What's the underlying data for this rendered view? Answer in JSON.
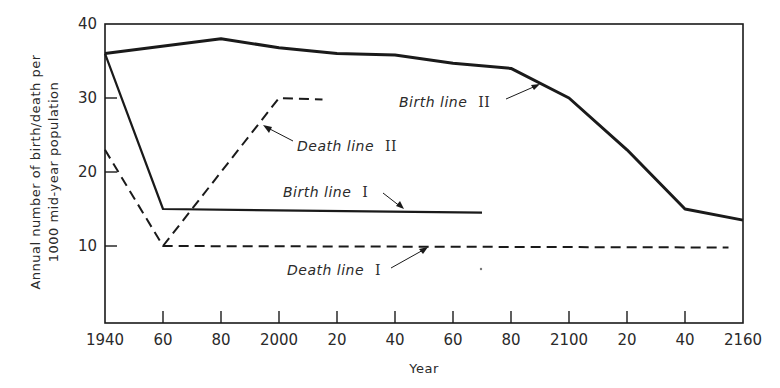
{
  "chart_data": {
    "type": "line",
    "title": "",
    "xlabel": "Year",
    "ylabel_lines": [
      "Annual number of birth/death per",
      "1000 mid-year population"
    ],
    "xlim": [
      1940,
      2160
    ],
    "ylim": [
      0,
      40
    ],
    "x_ticks": [
      1940,
      1960,
      1980,
      2000,
      2020,
      2040,
      2060,
      2080,
      2100,
      2120,
      2140,
      2160
    ],
    "x_tick_labels": [
      "1940",
      "60",
      "80",
      "2000",
      "20",
      "40",
      "60",
      "80",
      "2100",
      "20",
      "40",
      "2160"
    ],
    "y_ticks": [
      10,
      20,
      30,
      40
    ],
    "y_tick_labels": [
      "10",
      "20",
      "30",
      "40"
    ],
    "grid": false,
    "legend": "none (inline annotations)",
    "series": [
      {
        "name": "Birth line II",
        "style": "solid-thick",
        "x": [
          1940,
          1980,
          2000,
          2020,
          2040,
          2060,
          2080,
          2100,
          2120,
          2140,
          2160
        ],
        "values": [
          36,
          38,
          36.8,
          36,
          35.8,
          34.7,
          34,
          30,
          23,
          15,
          13.5
        ]
      },
      {
        "name": "Birth line I",
        "style": "solid",
        "x": [
          1940,
          1960,
          2070
        ],
        "values": [
          36,
          15,
          14.5
        ]
      },
      {
        "name": "Death line I",
        "style": "dashed",
        "x": [
          1940,
          1960,
          2155
        ],
        "values": [
          23,
          10,
          9.8
        ]
      },
      {
        "name": "Death line II",
        "style": "dashed",
        "x": [
          1960,
          2000,
          2015
        ],
        "values": [
          10,
          30,
          29.8
        ]
      }
    ],
    "annotations": [
      {
        "text": "Birth line",
        "numeral": "II",
        "target_series": "Birth line II"
      },
      {
        "text": "Death line",
        "numeral": "II",
        "target_series": "Death line II"
      },
      {
        "text": "Birth line",
        "numeral": "I",
        "target_series": "Birth line I"
      },
      {
        "text": "Death line",
        "numeral": "I",
        "target_series": "Death line I"
      }
    ]
  },
  "labels": {
    "xlabel": "Year",
    "ylabel_1": "Annual number of birth/death per",
    "ylabel_2": "1000 mid-year population",
    "ann_birth2": "Birth line",
    "ann_birth2_num": "II",
    "ann_death2": "Death line",
    "ann_death2_num": "II",
    "ann_birth1": "Birth line",
    "ann_birth1_num": "I",
    "ann_death1": "Death line",
    "ann_death1_num": "I"
  },
  "colors": {
    "ink": "#1a1a1a",
    "background": "#ffffff"
  }
}
